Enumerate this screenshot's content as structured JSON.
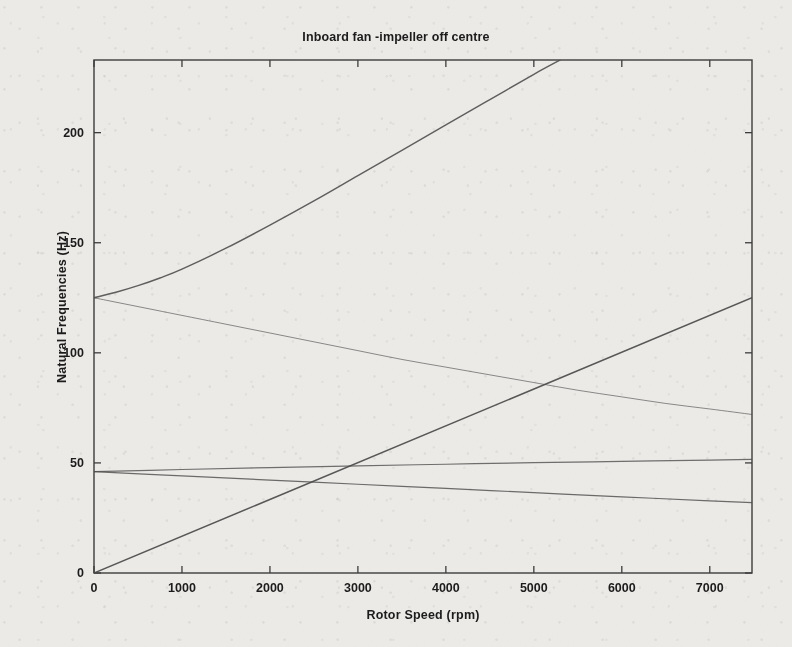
{
  "chart_data": {
    "type": "line",
    "title": "Inboard fan -impeller off centre",
    "xlabel": "Rotor Speed (rpm)",
    "ylabel": "Natural Frequencies (Hz)",
    "xlim": [
      0,
      7480
    ],
    "ylim": [
      0,
      233
    ],
    "grid": false,
    "legend": "none",
    "xticks": [
      0,
      1000,
      2000,
      3000,
      4000,
      5000,
      6000,
      7000
    ],
    "xticklabels": [
      "0",
      "1000",
      "2000",
      "3000",
      "4000",
      "5000",
      "6000",
      "7000"
    ],
    "yticks": [
      0,
      50,
      100,
      150,
      200
    ],
    "yticklabels": [
      "0",
      "50",
      "100",
      "150",
      "200"
    ],
    "line_color": "#4a4a4a",
    "axis_color": "#3c3c3c",
    "background_color": "#eceae7",
    "series": [
      {
        "name": "forward-whirl-mode-2",
        "x": [
          0,
          250,
          500,
          750,
          1000,
          1500,
          2000,
          2500,
          3000,
          3500,
          4000,
          4500,
          5000,
          5300
        ],
        "y": [
          125,
          127.5,
          130.5,
          134,
          138,
          147.5,
          158,
          169,
          180.5,
          192,
          203.5,
          215,
          226.5,
          233
        ]
      },
      {
        "name": "backward-whirl-mode-2",
        "x": [
          0,
          250,
          500,
          750,
          1000,
          1500,
          2000,
          2500,
          3000,
          3500,
          4000,
          4500,
          5000,
          5500,
          6000,
          6500,
          7000,
          7480
        ],
        "y": [
          125,
          123,
          121,
          119,
          117,
          113,
          109,
          105,
          101,
          97,
          93.5,
          90,
          86.5,
          83,
          80,
          77,
          74.5,
          72
        ]
      },
      {
        "name": "synchronous-1x-line",
        "x": [
          0,
          7480
        ],
        "y": [
          0,
          125
        ]
      },
      {
        "name": "forward-whirl-mode-1",
        "x": [
          0,
          1000,
          2000,
          3000,
          4000,
          5000,
          6000,
          7000,
          7480
        ],
        "y": [
          46,
          47,
          47.9,
          48.7,
          49.4,
          50.1,
          50.7,
          51.3,
          51.6
        ]
      },
      {
        "name": "backward-whirl-mode-1",
        "x": [
          0,
          1000,
          2000,
          3000,
          4000,
          5000,
          6000,
          7000,
          7480
        ],
        "y": [
          46,
          44.1,
          42.2,
          40.3,
          38.4,
          36.5,
          34.6,
          32.8,
          32
        ]
      }
    ],
    "annotations": [
      {
        "label": "mode-2 split point",
        "x": 0,
        "y": 125
      },
      {
        "label": "mode-1 split point",
        "x": 0,
        "y": 46
      },
      {
        "label": "critical-speed-crossing-backward-mode-1",
        "x": 2480,
        "y": 41.4
      },
      {
        "label": "critical-speed-crossing-forward-mode-1",
        "x": 2940,
        "y": 48.6
      },
      {
        "label": "critical-speed-crossing-backward-mode-2",
        "x": 4880,
        "y": 81.5
      }
    ]
  }
}
